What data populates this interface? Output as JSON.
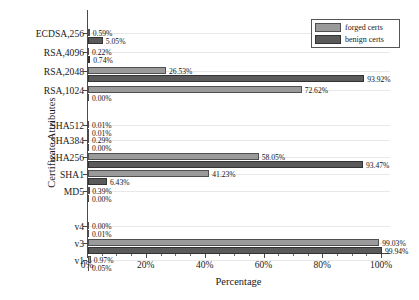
{
  "chart_data": {
    "type": "bar",
    "orientation": "horizontal",
    "title": "",
    "xlabel": "Percentage",
    "ylabel": "Certificate Attributes",
    "xlim": [
      0,
      103
    ],
    "grid": true,
    "legend_position": "top-right",
    "xticks": [
      "0%",
      "20%",
      "40%",
      "60%",
      "80%",
      "100%"
    ],
    "xtick_values": [
      0,
      20,
      40,
      60,
      80,
      100
    ],
    "minor_tick_step": 5,
    "categories": [
      "ECDSA,256",
      "RSA,4096",
      "RSA,2048",
      "RSA,1024",
      "SHA512",
      "SHA384",
      "SHA256",
      "SHA1",
      "MD5",
      "v4",
      "v3",
      "v1"
    ],
    "series": [
      {
        "name": "forged certs",
        "color": "#9a9a9a",
        "values": [
          0.59,
          0.22,
          26.53,
          72.62,
          0.01,
          0.29,
          58.05,
          41.23,
          0.39,
          0.0,
          99.03,
          0.97
        ],
        "labels": [
          "0.59%",
          "0.22%",
          "26.53%",
          "72.62%",
          "0.01%",
          "0.29%",
          "58.05%",
          "41.23%",
          "0.39%",
          "0.00%",
          "99.03%",
          "0.97%"
        ]
      },
      {
        "name": "benign certs",
        "color": "#5a5a5a",
        "values": [
          5.05,
          0.74,
          93.92,
          0.0,
          0.01,
          0.0,
          93.47,
          6.43,
          0.0,
          0.01,
          99.94,
          0.05
        ],
        "labels": [
          "5.05%",
          "0.74%",
          "93.92%",
          "0.00%",
          "0.01%",
          "0.00%",
          "93.47%",
          "6.43%",
          "0.00%",
          "0.01%",
          "99.94%",
          "0.05%"
        ]
      }
    ]
  },
  "legend": {
    "items": [
      {
        "label": "forged certs",
        "swatch": "forged"
      },
      {
        "label": "benign certs",
        "swatch": "benign"
      }
    ]
  },
  "layout": {
    "category_y": [
      19,
      38,
      57,
      76,
      111,
      126,
      143,
      160,
      177,
      212,
      229,
      246
    ],
    "gridline_y": [
      19,
      38,
      57,
      76,
      111,
      126,
      143,
      160,
      177,
      212,
      229,
      246
    ]
  }
}
